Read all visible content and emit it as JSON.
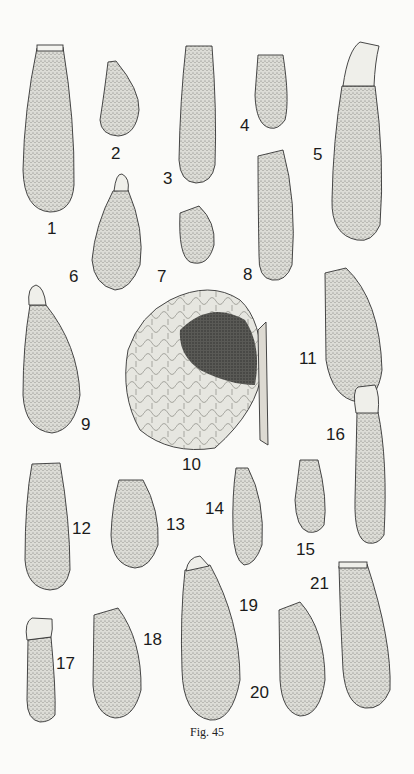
{
  "figure": {
    "caption": "Fig. 45",
    "specimens": [
      {
        "id": "1",
        "label": "1",
        "lx": 47,
        "ly": 220
      },
      {
        "id": "2",
        "label": "2",
        "lx": 111,
        "ly": 145
      },
      {
        "id": "3",
        "label": "3",
        "lx": 163,
        "ly": 170
      },
      {
        "id": "4",
        "label": "4",
        "lx": 240,
        "ly": 117
      },
      {
        "id": "5",
        "label": "5",
        "lx": 313,
        "ly": 146
      },
      {
        "id": "6",
        "label": "6",
        "lx": 69,
        "ly": 268
      },
      {
        "id": "7",
        "label": "7",
        "lx": 157,
        "ly": 268
      },
      {
        "id": "8",
        "label": "8",
        "lx": 243,
        "ly": 266
      },
      {
        "id": "9",
        "label": "9",
        "lx": 81,
        "ly": 416
      },
      {
        "id": "10",
        "label": "10",
        "lx": 182,
        "ly": 456
      },
      {
        "id": "11",
        "label": "11",
        "lx": 299,
        "ly": 350
      },
      {
        "id": "12",
        "label": "12",
        "lx": 72,
        "ly": 520
      },
      {
        "id": "13",
        "label": "13",
        "lx": 166,
        "ly": 516
      },
      {
        "id": "14",
        "label": "14",
        "lx": 205,
        "ly": 500
      },
      {
        "id": "15",
        "label": "15",
        "lx": 296,
        "ly": 541
      },
      {
        "id": "16",
        "label": "16",
        "lx": 326,
        "ly": 426
      },
      {
        "id": "17",
        "label": "17",
        "lx": 56,
        "ly": 655
      },
      {
        "id": "18",
        "label": "18",
        "lx": 143,
        "ly": 631
      },
      {
        "id": "19",
        "label": "19",
        "lx": 239,
        "ly": 597
      },
      {
        "id": "20",
        "label": "20",
        "lx": 250,
        "ly": 684
      },
      {
        "id": "21",
        "label": "21",
        "lx": 310,
        "ly": 575
      }
    ]
  }
}
